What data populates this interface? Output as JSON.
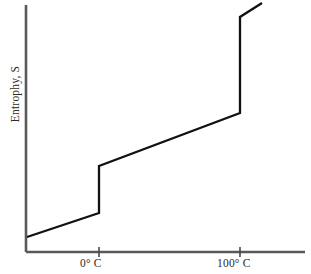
{
  "figure": {
    "top_caption_fragment": "ropy (S)",
    "ylabel": "Entrophy, S"
  },
  "chart_data": {
    "type": "line",
    "title": "",
    "xlabel": "",
    "ylabel": "Entrophy, S",
    "grid": false,
    "legend": null,
    "xtick_labels": [
      "0° C",
      "100° C"
    ],
    "xtick_values": [
      0,
      100
    ],
    "ytick_labels": [],
    "xlim": [
      -40,
      140
    ],
    "ylim": [
      0,
      10
    ],
    "axis_origin_px": {
      "x": 26,
      "y": 252
    },
    "axis_end_px": {
      "x": 305,
      "y": 5
    },
    "tick_px": [
      99,
      240
    ],
    "series": [
      {
        "name": "Entropy, S",
        "points_px": [
          {
            "x": 27,
            "y": 237
          },
          {
            "x": 99,
            "y": 213
          },
          {
            "x": 99,
            "y": 166
          },
          {
            "x": 240,
            "y": 113
          },
          {
            "x": 240,
            "y": 17
          },
          {
            "x": 262,
            "y": 3
          }
        ],
        "segments": [
          {
            "name": "solid-ice-heating",
            "type": "sloped",
            "from": [
              -40,
              1.0
            ],
            "to": [
              0,
              1.6
            ]
          },
          {
            "name": "melting-transition",
            "type": "vertical-jump",
            "at_x": 0,
            "from_y": 1.6,
            "to_y": 3.5
          },
          {
            "name": "liquid-water-heating",
            "type": "sloped",
            "from": [
              0,
              3.5
            ],
            "to": [
              100,
              5.6
            ]
          },
          {
            "name": "vaporization-transition",
            "type": "vertical-jump",
            "at_x": 100,
            "from_y": 5.6,
            "to_y": 9.5
          },
          {
            "name": "steam-heating",
            "type": "sloped",
            "from": [
              100,
              9.5
            ],
            "to": [
              116,
              10.0
            ]
          }
        ]
      }
    ],
    "colors": {
      "curve": "#111111",
      "axis": "#5a5a5a",
      "background": "#ffffff",
      "text": "#2b2b2b"
    }
  }
}
